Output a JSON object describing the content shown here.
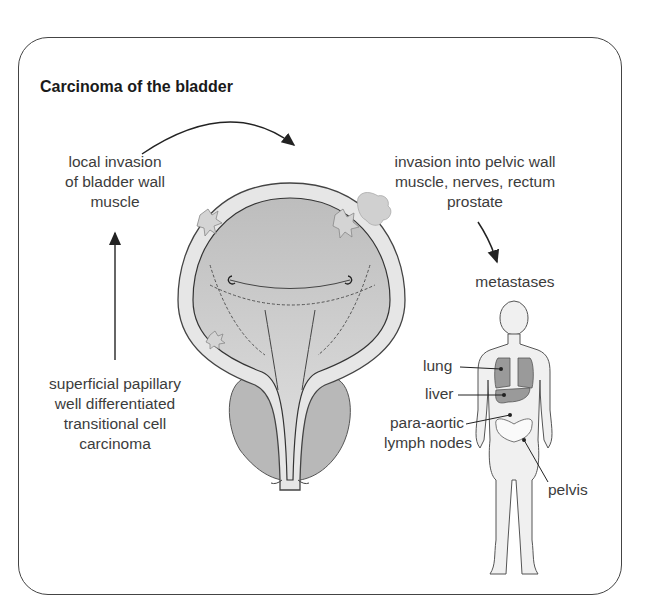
{
  "diagram": {
    "title": "Carcinoma of the bladder",
    "stages": {
      "superficial": [
        "superficial papillary",
        "well differentiated",
        "transitional cell",
        "carcinoma"
      ],
      "local_invasion": [
        "local invasion",
        "of bladder wall",
        "muscle"
      ],
      "pelvic_invasion": [
        "invasion into pelvic wall",
        "muscle, nerves, rectum",
        "prostate"
      ],
      "metastases": "metastases"
    },
    "metastasis_sites": {
      "lung": "lung",
      "liver": "liver",
      "para_aortic": [
        "para-aortic",
        "lymph nodes"
      ],
      "pelvis": "pelvis"
    },
    "colors": {
      "frame": "#444444",
      "bladder_fill": "#c9c9c9",
      "bladder_wall": "#e6e6e6",
      "prostate": "#b8b8b8",
      "organs": "#9a9a9a",
      "body_fill": "#f0f0f0"
    }
  }
}
